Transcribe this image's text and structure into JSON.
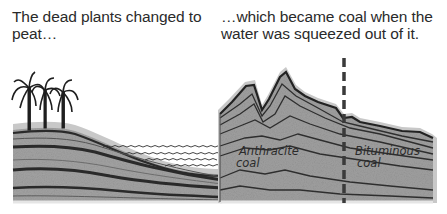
{
  "captions": {
    "left": "The dead plants changed to peat…",
    "right": "…which became coal when the water was squeezed out of it."
  },
  "labels": {
    "anthracite_line1": "Anthracite",
    "anthracite_line2": "coal",
    "bituminous_line1": "Bituminous",
    "bituminous_line2": "coal"
  },
  "colors": {
    "rock": "#9a9a9a",
    "rock_light": "#b4b4b4",
    "halo": "#c8c8c8",
    "seam": "#2e2e2e",
    "divider": "#3a3a3a"
  },
  "elements": {
    "trees": "palm-trees",
    "water": "wavy-water-lines",
    "divider": "dashed-vertical-boundary"
  }
}
